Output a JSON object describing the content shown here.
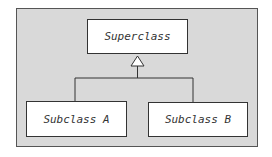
{
  "diagram": {
    "type": "uml-class-inheritance",
    "superclass": {
      "label": "Superclass"
    },
    "subclasses": [
      {
        "label": "Subclass A"
      },
      {
        "label": "Subclass B"
      }
    ],
    "relationship": "generalization",
    "colors": {
      "background": "#d9d9d9",
      "box": "#ffffff",
      "line": "#333333"
    }
  }
}
